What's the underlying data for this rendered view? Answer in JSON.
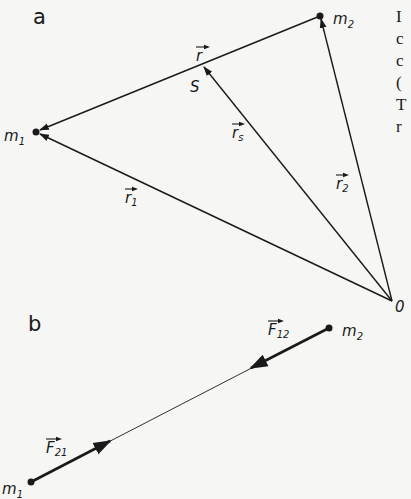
{
  "figure": {
    "panel_a": {
      "label": "a",
      "points": {
        "m1": {
          "label": "m",
          "sub": "1",
          "x": 36,
          "y": 132
        },
        "m2": {
          "label": "m",
          "sub": "2",
          "x": 320,
          "y": 16
        },
        "S": {
          "label": "S",
          "x": 203,
          "y": 65
        },
        "O": {
          "label": "0",
          "x": 392,
          "y": 301
        }
      },
      "vectors": {
        "r": {
          "label": "r",
          "sub": "",
          "from": "m2",
          "to": "m1"
        },
        "rs": {
          "label": "r",
          "sub": "s",
          "from": "O",
          "to": "S"
        },
        "r1": {
          "label": "r",
          "sub": "1",
          "from": "O",
          "to": "m1"
        },
        "r2": {
          "label": "r",
          "sub": "2",
          "from": "O",
          "to": "m2"
        }
      }
    },
    "panel_b": {
      "label": "b",
      "points": {
        "m1": {
          "label": "m",
          "sub": "1",
          "x": 31,
          "y": 482
        },
        "m2": {
          "label": "m",
          "sub": "2",
          "x": 329,
          "y": 328
        }
      },
      "forces": {
        "F21": {
          "label": "F",
          "sub": "21",
          "acts_on": "m1",
          "direction": "toward m2"
        },
        "F12": {
          "label": "F",
          "sub": "12",
          "acts_on": "m2",
          "direction": "toward m1"
        }
      }
    },
    "clipped_text_right": [
      "I",
      "c",
      "c",
      "(",
      "T",
      "r"
    ]
  }
}
